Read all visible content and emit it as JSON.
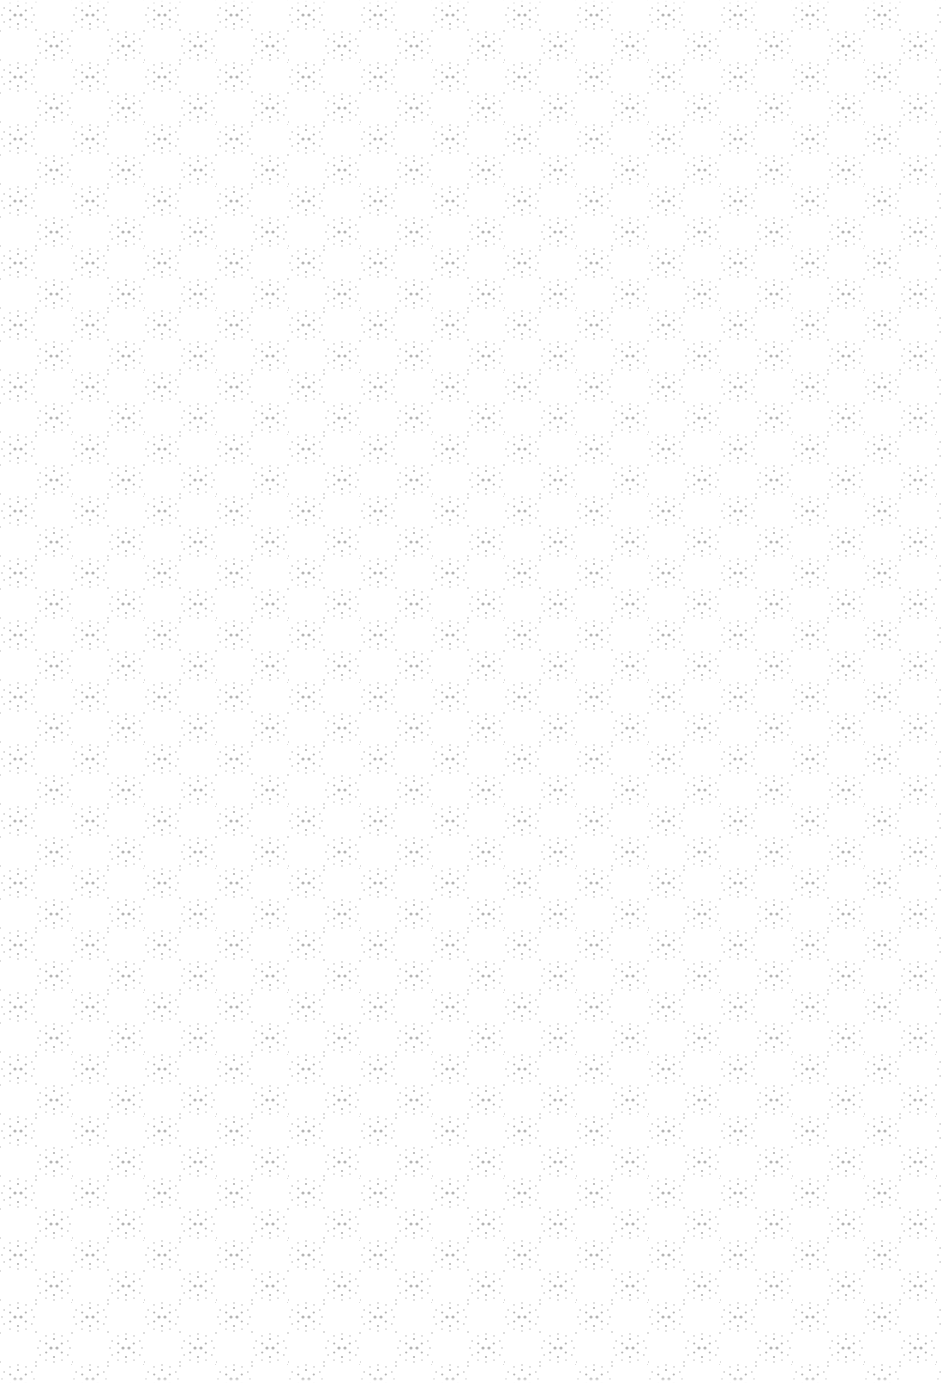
{
  "texture": {
    "kind": "dotted geometric background pattern",
    "background_color": "#ffffff",
    "dot_color": "#b4b4b4",
    "dot_color_light": "#d2d2d2",
    "motif": "hexagonal rosette of small dots"
  }
}
